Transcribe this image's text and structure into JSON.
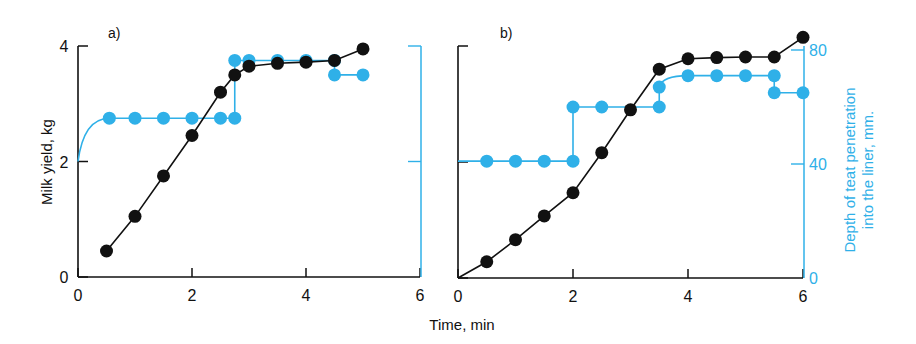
{
  "colors": {
    "milk": "#111111",
    "depth": "#2fb0e8"
  },
  "figure": {
    "xlabel": "Time, min",
    "ylabel_left": "Milk yield, kg",
    "ylabel_right_line1": "Depth of teat penetration",
    "ylabel_right_line2": "into the liner, mm."
  },
  "chart_data": [
    {
      "type": "line",
      "title": "a)",
      "xlabel": "Time, min",
      "ylabel": "Milk yield, kg",
      "y2label": "Depth of teat penetration into the liner, mm.",
      "xlim": [
        0,
        6
      ],
      "ylim": [
        0,
        4
      ],
      "y2lim": [
        0,
        80
      ],
      "xticks": [
        0,
        2,
        4,
        6
      ],
      "yticks": [
        0,
        2,
        4
      ],
      "y2ticks": [
        0,
        40,
        80
      ],
      "grid": false,
      "series": [
        {
          "name": "Milk yield (kg)",
          "axis": "left",
          "style": "line+markers",
          "x": [
            0.5,
            1.0,
            1.5,
            2.0,
            2.5,
            2.75,
            3.0,
            3.5,
            4.0,
            4.5,
            5.0
          ],
          "y": [
            0.45,
            1.05,
            1.75,
            2.45,
            3.2,
            3.5,
            3.65,
            3.7,
            3.72,
            3.75,
            3.95
          ]
        },
        {
          "name": "Teat penetration depth (mm)",
          "axis": "right",
          "style": "step+markers",
          "x": [
            0.0,
            0.55,
            1.0,
            1.5,
            2.0,
            2.5,
            2.75,
            2.75,
            3.0,
            3.5,
            4.0,
            4.5,
            4.5,
            5.0
          ],
          "y": [
            40,
            55,
            55,
            55,
            55,
            55,
            55,
            75,
            75,
            75,
            75,
            75,
            70,
            70
          ]
        }
      ]
    },
    {
      "type": "line",
      "title": "b)",
      "xlabel": "Time, min",
      "ylabel": "Milk yield, kg",
      "y2label": "Depth of teat penetration into the liner, mm.",
      "xlim": [
        0,
        6
      ],
      "ylim": [
        0,
        4
      ],
      "y2lim": [
        0,
        80
      ],
      "xticks": [
        0,
        2,
        4,
        6
      ],
      "yticks": [
        0,
        2,
        4
      ],
      "y2ticks": [
        0,
        40,
        80
      ],
      "grid": false,
      "series": [
        {
          "name": "Milk yield (kg)",
          "axis": "left",
          "style": "line+markers",
          "x": [
            0.0,
            0.5,
            1.0,
            1.5,
            2.0,
            2.5,
            3.0,
            3.5,
            4.0,
            4.5,
            5.0,
            5.5,
            6.0
          ],
          "y": [
            0.0,
            0.28,
            0.66,
            1.07,
            1.47,
            2.16,
            2.9,
            3.6,
            3.78,
            3.8,
            3.81,
            3.81,
            4.15
          ]
        },
        {
          "name": "Teat penetration depth (mm)",
          "axis": "right",
          "style": "step+markers",
          "x": [
            0.0,
            0.5,
            1.0,
            1.5,
            2.0,
            2.0,
            2.5,
            3.5,
            3.5,
            4.0,
            4.5,
            5.0,
            5.5,
            5.5,
            6.0
          ],
          "y": [
            41,
            41,
            41,
            41,
            41,
            60,
            60,
            60,
            67,
            71,
            71,
            71,
            71,
            65,
            65
          ]
        }
      ]
    }
  ]
}
